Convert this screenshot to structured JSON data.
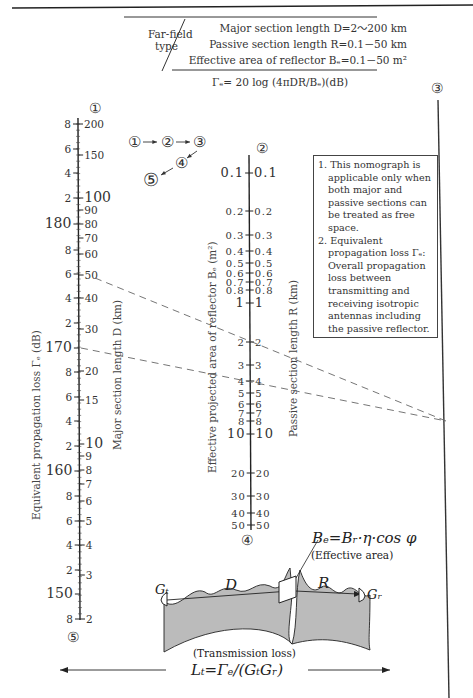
{
  "header": {
    "type_label_line1": "Far-field",
    "type_label_line2": "type",
    "param_D": "Major section length D=2～200 km",
    "param_R": "Passive section length R=0.1－50 km",
    "param_B": "Effective area of reflector Bₑ=0.1－50 m²",
    "formula": "Γₑ= 20 log (4πDR/Bₑ)(dB)"
  },
  "flow": {
    "steps": [
      "①",
      "②",
      "③",
      "④",
      "⑤"
    ],
    "description": "① → ② → ③ → ④ → ⑤"
  },
  "scales": {
    "scale1": {
      "marker": "①",
      "bottom_marker": "⑤",
      "right_label": "Major section length D (km)",
      "left_label": "Equivalent propagation loss Γₑ (dB)",
      "right_ticks": [
        {
          "v": "200",
          "y": 124
        },
        {
          "v": "150",
          "y": 155
        },
        {
          "v": "100",
          "y": 198
        },
        {
          "v": "90",
          "y": 210
        },
        {
          "v": "80",
          "y": 224
        },
        {
          "v": "70",
          "y": 238
        },
        {
          "v": "60",
          "y": 254
        },
        {
          "v": "50",
          "y": 275
        },
        {
          "v": "40",
          "y": 298
        },
        {
          "v": "30",
          "y": 329
        },
        {
          "v": "20",
          "y": 371
        },
        {
          "v": "15",
          "y": 400
        },
        {
          "v": "10",
          "y": 444
        },
        {
          "v": "9",
          "y": 456
        },
        {
          "v": "8",
          "y": 470
        },
        {
          "v": "7",
          "y": 484
        },
        {
          "v": "6",
          "y": 501
        },
        {
          "v": "5",
          "y": 521
        },
        {
          "v": "4",
          "y": 545
        },
        {
          "v": "3",
          "y": 575
        },
        {
          "v": "2",
          "y": 619
        }
      ],
      "left_ticks": [
        {
          "v": "8",
          "y": 124,
          "big": false
        },
        {
          "v": "6",
          "y": 149,
          "big": false
        },
        {
          "v": "4",
          "y": 173,
          "big": false
        },
        {
          "v": "2",
          "y": 198,
          "big": false
        },
        {
          "v": "180",
          "y": 224,
          "big": true
        },
        {
          "v": "8",
          "y": 250,
          "big": false
        },
        {
          "v": "6",
          "y": 274,
          "big": false
        },
        {
          "v": "4",
          "y": 298,
          "big": false
        },
        {
          "v": "2",
          "y": 323,
          "big": false
        },
        {
          "v": "170",
          "y": 348,
          "big": true
        },
        {
          "v": "8",
          "y": 372,
          "big": false
        },
        {
          "v": "6",
          "y": 397,
          "big": false
        },
        {
          "v": "4",
          "y": 421,
          "big": false
        },
        {
          "v": "2",
          "y": 446,
          "big": false
        },
        {
          "v": "160",
          "y": 471,
          "big": true
        },
        {
          "v": "8",
          "y": 496,
          "big": false
        },
        {
          "v": "6",
          "y": 521,
          "big": false
        },
        {
          "v": "4",
          "y": 545,
          "big": false
        },
        {
          "v": "2",
          "y": 570,
          "big": false
        },
        {
          "v": "150",
          "y": 594,
          "big": true
        },
        {
          "v": "8",
          "y": 619,
          "big": false
        }
      ]
    },
    "scale2": {
      "marker": "②",
      "bottom_marker": "④",
      "left_label": "Effective projected area of reflector Bₑ (m²)",
      "right_label": "Passive section length R (km)",
      "ticks": [
        {
          "v": "0.1",
          "y": 173
        },
        {
          "v": "0.2",
          "y": 211
        },
        {
          "v": "0.3",
          "y": 235
        },
        {
          "v": "0.4",
          "y": 251
        },
        {
          "v": "0.5",
          "y": 263
        },
        {
          "v": "0.6",
          "y": 273
        },
        {
          "v": "0.7",
          "y": 282
        },
        {
          "v": "0.8",
          "y": 290
        },
        {
          "v": "1",
          "y": 303
        },
        {
          "v": "2",
          "y": 342
        },
        {
          "v": "3",
          "y": 365
        },
        {
          "v": "4",
          "y": 381
        },
        {
          "v": "5",
          "y": 393
        },
        {
          "v": "6",
          "y": 404
        },
        {
          "v": "7",
          "y": 413
        },
        {
          "v": "8",
          "y": 421
        },
        {
          "v": "10",
          "y": 434
        },
        {
          "v": "20",
          "y": 473
        },
        {
          "v": "30",
          "y": 496
        },
        {
          "v": "40",
          "y": 513
        },
        {
          "v": "50",
          "y": 525
        }
      ]
    },
    "scale3": {
      "marker": "③"
    }
  },
  "notes": {
    "item1": "1. This nomograph is applicable only when both major and passive sections can be treated as free space.",
    "item2": "2. Equivalent propagation loss Γₑ: Overall propagation loss between transmitting and receiving isotropic antennas including the passive reflector."
  },
  "example": {
    "line1": {
      "from": "D=50 km",
      "pivot": "③"
    },
    "line2": {
      "from": "Γₑ=170 dB",
      "pivot": "③"
    }
  },
  "diagram": {
    "effective_area_formula": "Bₑ=Bᵣ·η·cos φ",
    "effective_area_caption": "(Effective area)",
    "label_Gt": "Gₜ",
    "label_Gr": "Gᵣ",
    "label_D": "D",
    "label_R": "R",
    "transmission_caption": "(Transmission loss)",
    "loss_formula": "Lₜ=Γₑ/(GₜGᵣ)"
  }
}
